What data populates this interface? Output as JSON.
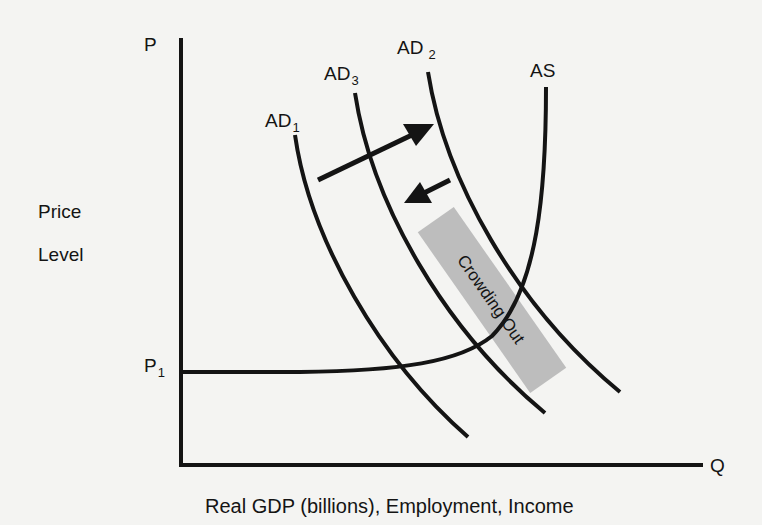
{
  "diagram": {
    "type": "aggregate supply / aggregate demand",
    "y_axis": {
      "symbol": "P",
      "label_line1": "Price",
      "label_line2": "Level",
      "price_mark": "P",
      "price_mark_sub": "1"
    },
    "x_axis": {
      "symbol": "Q",
      "label": "Real GDP (billions), Employment, Income"
    },
    "curves": {
      "ad1": {
        "base": "AD",
        "sub": "1"
      },
      "ad2": {
        "base": "AD",
        "sub": "2"
      },
      "ad3": {
        "base": "AD",
        "sub": "3"
      },
      "as": {
        "label": "AS"
      }
    },
    "annotation": {
      "text": "Crowding Out",
      "fill": "#bdbdbd"
    },
    "arrows": [
      {
        "name": "shift-right",
        "from": "AD1",
        "to": "AD2"
      },
      {
        "name": "shift-left",
        "from": "AD2",
        "to": "AD3"
      }
    ],
    "colors": {
      "ink": "#141414",
      "background": "#f4f4f2",
      "band": "#bdbdbd"
    }
  }
}
